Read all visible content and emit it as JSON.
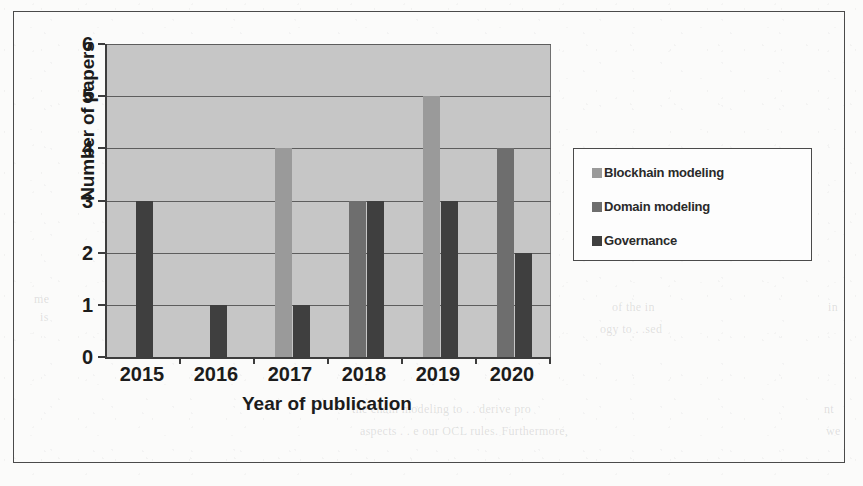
{
  "figure": {
    "frame_border_color": "#4a4a4a",
    "plot_background": "#c6c6c6",
    "axis_color": "#3d3d3d",
    "gridline_color": "#5d5d5d"
  },
  "chart_data": {
    "type": "bar",
    "title": "",
    "subtitle": "",
    "xlabel": "Year of publication",
    "ylabel": "Number of papers",
    "categories": [
      "2015",
      "2016",
      "2017",
      "2018",
      "2019",
      "2020"
    ],
    "ytick_labels": [
      "0",
      "1",
      "2",
      "3",
      "4",
      "5",
      "6"
    ],
    "ylim": [
      0,
      6
    ],
    "ytick_step": 1,
    "grid": true,
    "grid_axis": "y",
    "legend_position": "right",
    "series": [
      {
        "name": "Blockhain modeling",
        "color": "#9a9a9a",
        "values": [
          0,
          0,
          4,
          0,
          5,
          0
        ]
      },
      {
        "name": "Domain modeling",
        "color": "#6e6e6e",
        "values": [
          0,
          0,
          0,
          3,
          0,
          4
        ]
      },
      {
        "name": "Governance",
        "color": "#3f3f3f",
        "values": [
          3,
          1,
          1,
          3,
          3,
          2
        ]
      }
    ],
    "annotations": []
  },
  "legend": {
    "items": [
      {
        "label": "Blockhain modeling",
        "color": "#9a9a9a",
        "swatch": "square-swatch"
      },
      {
        "label": "Domain modeling",
        "color": "#6e6e6e",
        "swatch": "square-swatch"
      },
      {
        "label": "Governance",
        "color": "#3f3f3f",
        "swatch": "square-swatch"
      }
    ]
  },
  "background_artifacts": {
    "ghost_lines": [
      {
        "text": "of the in",
        "x": 612,
        "y": 300
      },
      {
        "text": "ogy to . .sed",
        "x": 600,
        "y": 322
      },
      {
        "text": "the chain modeling to . . derive pro",
        "x": 352,
        "y": 402
      },
      {
        "text": "aspects . . e our OCL rules. Furthermore,",
        "x": 360,
        "y": 424
      },
      {
        "text": "we",
        "x": 826,
        "y": 424
      },
      {
        "text": "nt",
        "x": 824,
        "y": 402
      },
      {
        "text": "in",
        "x": 828,
        "y": 300
      },
      {
        "text": "is",
        "x": 40,
        "y": 310
      },
      {
        "text": "me",
        "x": 34,
        "y": 292
      }
    ]
  }
}
